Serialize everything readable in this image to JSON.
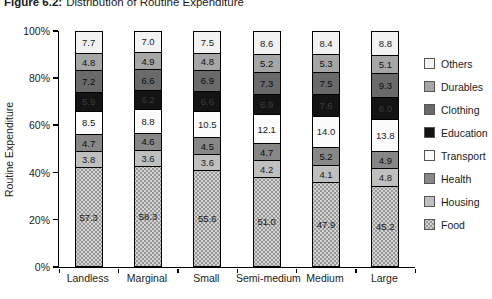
{
  "title": {
    "prefix": "Figure 6.2:",
    "text": "Distribution of Routine Expenditure"
  },
  "chart_data": {
    "type": "bar",
    "stacked": true,
    "ylabel": "Routine Expenditure",
    "xlabel": "",
    "ylim": [
      0,
      100
    ],
    "grid": false,
    "legend_position": "right",
    "y_ticks": [
      "0%",
      "20%",
      "40%",
      "60%",
      "80%",
      "100%"
    ],
    "categories": [
      "Landless",
      "Marginal",
      "Small",
      "Semi-medium",
      "Medium",
      "Large"
    ],
    "series": [
      {
        "name": "Others",
        "color": "#f2f2f2",
        "label_color": "#1a1a1a",
        "textured": false,
        "values": [
          7.7,
          7.0,
          7.5,
          8.6,
          8.4,
          8.8
        ]
      },
      {
        "name": "Durables",
        "color": "#a6a6a6",
        "label_color": "#111111",
        "textured": false,
        "values": [
          4.8,
          4.9,
          4.8,
          5.2,
          5.3,
          5.1
        ]
      },
      {
        "name": "Clothing",
        "color": "#6a6a6a",
        "label_color": "#0d0d0d",
        "textured": false,
        "values": [
          7.2,
          6.6,
          6.9,
          7.3,
          7.5,
          9.3
        ]
      },
      {
        "name": "Education",
        "color": "#141414",
        "label_color": "#3c3c3c",
        "textured": false,
        "values": [
          5.9,
          6.2,
          6.6,
          6.9,
          7.6,
          8.0
        ]
      },
      {
        "name": "Transport",
        "color": "#fbfbfb",
        "label_color": "#1a1a1a",
        "textured": false,
        "values": [
          8.5,
          8.8,
          10.5,
          12.1,
          14.0,
          13.8
        ]
      },
      {
        "name": "Health",
        "color": "#878787",
        "label_color": "#0d0d0d",
        "textured": false,
        "values": [
          4.7,
          4.6,
          4.5,
          4.7,
          5.2,
          4.9
        ]
      },
      {
        "name": "Housing",
        "color": "#bfbfbf",
        "label_color": "#1a1a1a",
        "textured": false,
        "values": [
          3.8,
          3.6,
          3.6,
          4.2,
          4.1,
          4.8
        ]
      },
      {
        "name": "Food",
        "color": "#d2d2d2",
        "label_color": "#1a1a1a",
        "textured": true,
        "values": [
          57.3,
          58.3,
          55.6,
          51.0,
          47.9,
          45.2
        ]
      }
    ]
  }
}
